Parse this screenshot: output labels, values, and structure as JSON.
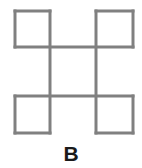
{
  "figure": {
    "caption": "B",
    "caption_label": "B",
    "alt_description": "Four open squares arranged in a 2 by 2 pinwheel lattice joined by shared edges",
    "stroke_color": "#808080",
    "background_color": "#ffffff",
    "caption_color": "#1a1a1a",
    "stroke_width": 3,
    "geometry": {
      "x_left": 15,
      "x_mid_left": 50,
      "x_mid_right": 96,
      "x_right": 133,
      "y_top": 11,
      "y_mid_upper": 47,
      "y_mid_lower": 96,
      "y_bottom": 133
    },
    "squares": [
      {
        "name": "top-left-square",
        "x": 15,
        "y": 11,
        "width": 35,
        "height": 36
      },
      {
        "name": "top-right-square",
        "x": 96,
        "y": 11,
        "width": 37,
        "height": 36
      },
      {
        "name": "bottom-left-square",
        "x": 15,
        "y": 96,
        "width": 35,
        "height": 37
      },
      {
        "name": "bottom-right-square",
        "x": 96,
        "y": 96,
        "width": 37,
        "height": 37
      }
    ],
    "connectors": [
      {
        "name": "upper-horizontal-connector",
        "x1": 50,
        "y1": 47,
        "x2": 96,
        "y2": 47
      },
      {
        "name": "lower-horizontal-connector",
        "x1": 50,
        "y1": 96,
        "x2": 96,
        "y2": 96
      },
      {
        "name": "left-vertical-connector",
        "x1": 50,
        "y1": 47,
        "x2": 50,
        "y2": 96
      },
      {
        "name": "right-vertical-connector",
        "x1": 96,
        "y1": 47,
        "x2": 96,
        "y2": 96
      }
    ]
  }
}
